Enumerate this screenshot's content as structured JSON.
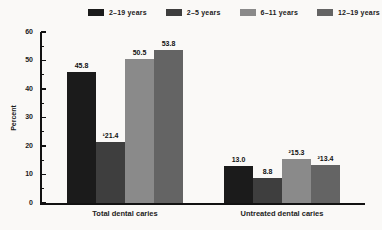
{
  "chart_data": {
    "type": "bar",
    "ylabel": "Percent",
    "ylim": [
      0,
      60
    ],
    "yticks": [
      0,
      10,
      20,
      30,
      40,
      50,
      60
    ],
    "minor_tick_step": 5,
    "grid": false,
    "legend_position": "top",
    "categories": [
      "Total dental caries",
      "Untreated dental caries"
    ],
    "series": [
      {
        "name": "2–19 years",
        "color": "#1b1b1b",
        "values": [
          45.8,
          13.0
        ],
        "labels": [
          "45.8",
          "13.0"
        ]
      },
      {
        "name": "2–5 years",
        "color": "#3e3e3e",
        "values": [
          21.4,
          8.8
        ],
        "labels": [
          "¹21.4",
          "8.8"
        ]
      },
      {
        "name": "6–11 years",
        "color": "#8a8a8a",
        "values": [
          50.5,
          15.3
        ],
        "labels": [
          "50.5",
          "²15.3"
        ]
      },
      {
        "name": "12–19 years",
        "color": "#646464",
        "values": [
          53.8,
          13.4
        ],
        "labels": [
          "53.8",
          "²13.4"
        ]
      }
    ]
  }
}
